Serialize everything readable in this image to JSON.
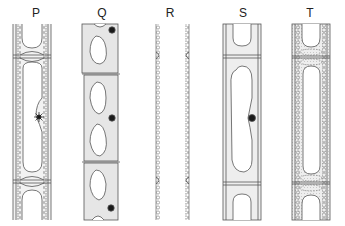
{
  "figure": {
    "type": "cell-diagram",
    "panels": [
      {
        "id": "P",
        "label": "P",
        "x": 36,
        "description": "plant cells with granular cytoplasm lining, central vacuole, nucleus as star shape (dividing)"
      },
      {
        "id": "Q",
        "label": "Q",
        "x": 102,
        "description": "three cells each with two vacuoles and a dark nucleus, shaded cytoplasm"
      },
      {
        "id": "R",
        "label": "R",
        "x": 170,
        "description": "only beaded/wavy cell walls remain, no cell contents"
      },
      {
        "id": "S",
        "label": "S",
        "x": 243,
        "description": "cells with single large vacuole and dark nucleus, shaded cytoplasm"
      },
      {
        "id": "T",
        "label": "T",
        "x": 310,
        "description": "cells with thickened beaded walls, dotted cytoplasm, elongated empty vacuole"
      }
    ]
  },
  "colors": {
    "line": "#555555",
    "cytoplasm": "#e6e6e6",
    "nucleus": "#1a1a1a",
    "background": "#ffffff"
  }
}
